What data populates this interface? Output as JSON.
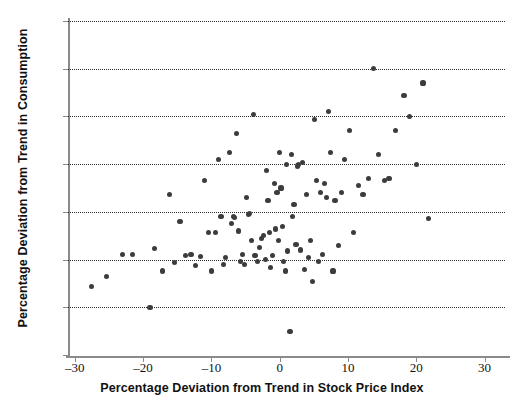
{
  "chart_data": {
    "type": "scatter",
    "title": "",
    "xlabel": "Percentage Deviation from Trend in Stock Price Index",
    "ylabel": "Percentage Deviation from Trend in Consumption",
    "xlim": [
      -31,
      33
    ],
    "ylim": [
      -1.5,
      2
    ],
    "xticks": [
      -30,
      -20,
      -10,
      0,
      10,
      20,
      30
    ],
    "xtick_labels": [
      "–30",
      "–20",
      "–10",
      "0",
      "10",
      "20",
      "30"
    ],
    "yticks": [
      -1.5,
      -1,
      -0.5,
      0,
      0.5,
      1,
      1.5,
      2
    ],
    "ytick_labels": [
      "–1.5",
      "–1",
      "–0.5",
      "0",
      "0.5",
      "1",
      "1.5",
      "2"
    ],
    "grid": "horizontal-dotted",
    "legend": null,
    "marker": {
      "shape": "circle",
      "color": "#3c3c3c",
      "size": 5
    },
    "points": [
      [
        -27.5,
        -0.78
      ],
      [
        -25.4,
        -0.68
      ],
      [
        -23.0,
        -0.45
      ],
      [
        -21.6,
        -0.45
      ],
      [
        -19.0,
        -1.0
      ],
      [
        -18.3,
        -0.38
      ],
      [
        -17.2,
        -0.62
      ],
      [
        -16.1,
        0.18
      ],
      [
        -15.4,
        -0.53
      ],
      [
        -14.6,
        -0.1
      ],
      [
        -13.8,
        -0.46
      ],
      [
        -13.0,
        -0.45
      ],
      [
        -12.3,
        -0.56
      ],
      [
        -11.6,
        -0.47
      ],
      [
        -11.0,
        0.33
      ],
      [
        -10.4,
        -0.22
      ],
      [
        -10.0,
        -0.62
      ],
      [
        -9.4,
        -0.22
      ],
      [
        -9.0,
        0.55
      ],
      [
        -8.6,
        -0.05
      ],
      [
        -8.2,
        -0.55
      ],
      [
        -7.9,
        -0.48
      ],
      [
        -7.4,
        0.62
      ],
      [
        -7.1,
        -0.12
      ],
      [
        -6.8,
        -0.05
      ],
      [
        -6.6,
        -0.06
      ],
      [
        -6.3,
        0.82
      ],
      [
        -6.0,
        -0.2
      ],
      [
        -5.7,
        -0.52
      ],
      [
        -5.4,
        -0.45
      ],
      [
        -5.1,
        -0.55
      ],
      [
        -4.8,
        0.15
      ],
      [
        -4.6,
        -0.03
      ],
      [
        -4.4,
        -0.02
      ],
      [
        -4.1,
        -0.3
      ],
      [
        -3.8,
        1.02
      ],
      [
        -3.6,
        -0.46
      ],
      [
        -3.3,
        -0.52
      ],
      [
        -3.0,
        -0.37
      ],
      [
        -2.7,
        -0.28
      ],
      [
        -2.4,
        -0.25
      ],
      [
        -2.1,
        -0.5
      ],
      [
        -1.9,
        0.43
      ],
      [
        -1.7,
        0.12
      ],
      [
        -1.5,
        -0.22
      ],
      [
        -1.3,
        -0.58
      ],
      [
        -1.0,
        -0.46
      ],
      [
        -0.8,
        0.3
      ],
      [
        -0.6,
        -0.18
      ],
      [
        -0.4,
        0.2
      ],
      [
        -0.2,
        -0.3
      ],
      [
        0.0,
        0.62
      ],
      [
        0.2,
        0.25
      ],
      [
        0.4,
        -0.15
      ],
      [
        0.6,
        -0.52
      ],
      [
        0.8,
        -0.62
      ],
      [
        1.0,
        0.5
      ],
      [
        1.2,
        -0.41
      ],
      [
        1.5,
        -1.25
      ],
      [
        1.7,
        0.6
      ],
      [
        1.9,
        -0.05
      ],
      [
        2.1,
        0.08
      ],
      [
        2.4,
        -0.34
      ],
      [
        2.6,
        0.48
      ],
      [
        2.8,
        0.5
      ],
      [
        3.0,
        -0.4
      ],
      [
        3.3,
        0.52
      ],
      [
        3.6,
        -0.6
      ],
      [
        3.9,
        0.18
      ],
      [
        4.2,
        -0.48
      ],
      [
        4.5,
        -0.3
      ],
      [
        4.8,
        -0.73
      ],
      [
        5.1,
        0.97
      ],
      [
        5.4,
        0.33
      ],
      [
        5.7,
        -0.52
      ],
      [
        6.0,
        0.2
      ],
      [
        6.3,
        -0.45
      ],
      [
        6.6,
        0.3
      ],
      [
        6.9,
        0.15
      ],
      [
        7.2,
        1.05
      ],
      [
        7.5,
        0.62
      ],
      [
        7.8,
        -0.62
      ],
      [
        8.1,
        0.12
      ],
      [
        8.6,
        -0.35
      ],
      [
        9.0,
        0.2
      ],
      [
        9.5,
        0.55
      ],
      [
        10.2,
        0.85
      ],
      [
        10.8,
        -0.22
      ],
      [
        11.5,
        0.28
      ],
      [
        12.2,
        0.18
      ],
      [
        13.0,
        0.35
      ],
      [
        13.8,
        1.5
      ],
      [
        14.5,
        0.6
      ],
      [
        15.3,
        0.33
      ],
      [
        16.0,
        0.35
      ],
      [
        17.0,
        0.85
      ],
      [
        18.2,
        1.22
      ],
      [
        19.0,
        1.0
      ],
      [
        20.0,
        0.5
      ],
      [
        21.0,
        1.35
      ],
      [
        21.8,
        -0.07
      ]
    ]
  }
}
